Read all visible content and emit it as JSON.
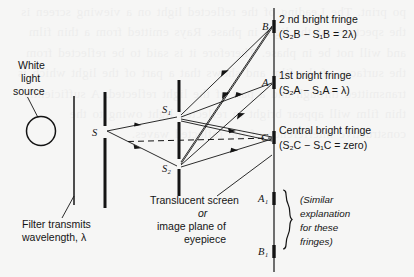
{
  "figure": {
    "title_semantics": "young-double-slit-interference-diagram",
    "background_color": "#f6f6f5",
    "ink_color": "#141414",
    "source": {
      "label_line1": "White",
      "label_line2": "light",
      "label_line3": "source",
      "lamp_icon": "lamp-circle-icon"
    },
    "filter": {
      "caption_line1": "Filter  transmits",
      "caption_line2": "wavelength, λ"
    },
    "slits": {
      "single_slit_label": "S",
      "upper_slit_label": "S₁",
      "lower_slit_label": "S₂"
    },
    "screen": {
      "caption_line1": "Translucent  screen",
      "caption_line2": "or",
      "caption_line3": "image  plane  of",
      "caption_line4": "eyepiece"
    },
    "fringes": [
      {
        "point": "B",
        "name": "2 nd  bright  fringe",
        "equation": "(S₂B − S₁B = 2λ)"
      },
      {
        "point": "A",
        "name": "1st  bright  fringe",
        "equation": "(S₂A − S₁A = λ)"
      },
      {
        "point": "C",
        "name": "Central  bright  fringe",
        "equation": "(S₂C − S₁C = zero)"
      }
    ],
    "lower_fringes": {
      "upper_label": "A₁",
      "lower_label": "B₁",
      "note_line1": "(Similar",
      "note_line2": "explanation",
      "note_line3": "for  these",
      "note_line4": "fringes)"
    },
    "bleed_through_text": "po print. The Leading of the reflected light on a viewing screen is the spectrum of the light in phase. Rays emitted from a thin film and will not be in phase. Therefore it is said to be reflected from the surfaces of the film and shows that a part of the light which is transmitted through and a part of the light reflected. A sufficiently thin film will appear bright in reflected light owing to the constructive interference of the reflected waves."
  }
}
